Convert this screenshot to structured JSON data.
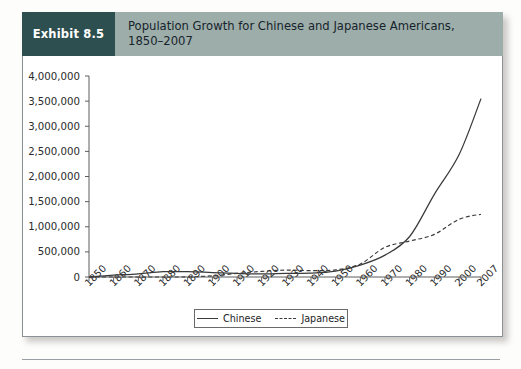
{
  "exhibit": {
    "tag_label": "Exhibit 8.5",
    "title": "Population Growth for Chinese and Japanese Americans,\n1850–2007"
  },
  "legend": {
    "entries": [
      {
        "label": "Chinese",
        "style": "solid"
      },
      {
        "label": "Japanese",
        "style": "dashed"
      }
    ]
  },
  "colors": {
    "tag_background": "#2d4f4f",
    "header_background": "#9dadaa",
    "panel_background": "#ffffff",
    "line_color": "#3a3a3a",
    "axis_color": "#5d5d5d"
  },
  "chart_data": {
    "type": "line",
    "title": "Population Growth for Chinese and Japanese Americans, 1850–2007",
    "xlabel": "",
    "ylabel": "",
    "ylim": [
      0,
      4000000
    ],
    "ytick_labels": [
      "4,000,000",
      "3,500,000",
      "3,000,000",
      "2,500,000",
      "2,000,000",
      "1,500,000",
      "1,000,000",
      "500,000",
      "0"
    ],
    "ytick_values": [
      4000000,
      3500000,
      3000000,
      2500000,
      2000000,
      1500000,
      1000000,
      500000,
      0
    ],
    "grid": false,
    "legend_position": "bottom-center",
    "x": [
      1850,
      1860,
      1870,
      1880,
      1890,
      1900,
      1910,
      1920,
      1930,
      1940,
      1950,
      1960,
      1970,
      1980,
      1990,
      2000,
      2007
    ],
    "xtick_labels": [
      "1850",
      "1860",
      "1870",
      "1880",
      "1890",
      "1900",
      "1910",
      "1920",
      "1930",
      "1940",
      "1950",
      "1960",
      "1970",
      "1980",
      "1990",
      "2000",
      "2007"
    ],
    "series": [
      {
        "name": "Chinese",
        "style": "solid",
        "values": [
          4000,
          35000,
          63000,
          105000,
          107000,
          89000,
          71000,
          61000,
          74000,
          77000,
          117000,
          237000,
          435000,
          806000,
          1645000,
          2432000,
          3550000
        ]
      },
      {
        "name": "Japanese",
        "style": "dashed",
        "values": [
          0,
          0,
          0,
          150,
          2000,
          24000,
          72000,
          111000,
          138000,
          127000,
          141000,
          260000,
          591000,
          716000,
          848000,
          1148000,
          1250000
        ]
      }
    ]
  }
}
